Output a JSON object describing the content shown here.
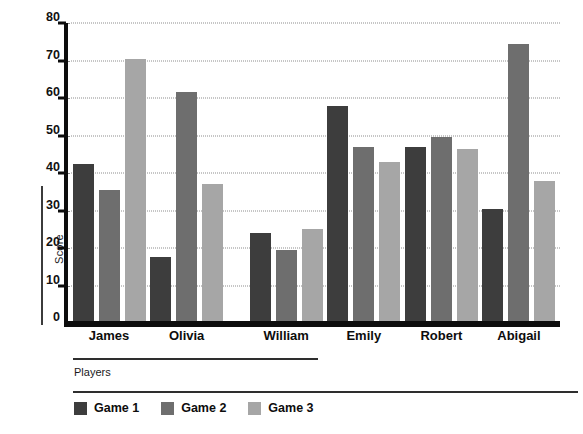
{
  "chart_data": {
    "type": "bar",
    "title": "",
    "xlabel": "Players",
    "ylabel": "Score",
    "categories": [
      "James",
      "Olivia",
      "William",
      "Emily",
      "Robert",
      "Abigail"
    ],
    "series": [
      {
        "name": "Game 1",
        "color": "#3d3d3d",
        "values": [
          42.5,
          17.5,
          24,
          58,
          47,
          30.5
        ]
      },
      {
        "name": "Game 2",
        "color": "#6e6e6e",
        "values": [
          35.5,
          61.5,
          19.5,
          47,
          49.5,
          74.5
        ]
      },
      {
        "name": "Game 3",
        "color": "#a6a6a6",
        "values": [
          70.5,
          37,
          25,
          43,
          46.5,
          38
        ]
      }
    ],
    "ylim": [
      0,
      80
    ],
    "yticks": [
      0,
      10,
      20,
      30,
      40,
      50,
      60,
      70,
      80
    ],
    "grid": true,
    "legend_position": "bottom-left",
    "group_gap_after_index": 2
  },
  "axis": {
    "y_label": "Score",
    "x_label": "Players",
    "y_tick_labels": [
      "0",
      "10",
      "20",
      "30",
      "40",
      "50",
      "60",
      "70",
      "80"
    ]
  },
  "legend": {
    "items": [
      {
        "label": "Game 1",
        "color": "#3d3d3d"
      },
      {
        "label": "Game 2",
        "color": "#6e6e6e"
      },
      {
        "label": "Game 3",
        "color": "#a6a6a6"
      }
    ]
  },
  "colors": {
    "background": "#ffffff",
    "axis": "#0d0d0d",
    "grid": "#8d8d8d",
    "text": "#0d0d0d",
    "rule": "#2e2e2e"
  }
}
